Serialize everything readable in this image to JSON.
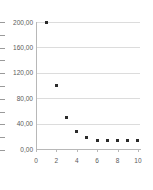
{
  "chart_data": {
    "type": "scatter",
    "title": "",
    "subtitle": "",
    "xlabel": "",
    "ylabel": ")",
    "x": [
      1,
      2,
      3,
      4,
      5,
      6,
      7,
      8,
      9,
      10
    ],
    "values": [
      200,
      100,
      50,
      28,
      18,
      14,
      13,
      13,
      13,
      13
    ],
    "series": [
      {
        "name": "",
        "x": [
          1,
          2,
          3,
          4,
          5,
          6,
          7,
          8,
          9,
          10
        ],
        "values": [
          200,
          100,
          50,
          28,
          18,
          14,
          13,
          13,
          13,
          13
        ],
        "marker_color": "#2b2b2b",
        "marker_shape": "square"
      }
    ],
    "xlim": [
      0,
      10.2
    ],
    "ylim": [
      0,
      210
    ],
    "ytick_values": [
      200,
      160,
      120,
      80,
      40,
      0
    ],
    "ytick_labels": [
      "200,00",
      "160,00",
      "120,00",
      "80,00",
      "40,00",
      "0,00"
    ],
    "xtick_values": [
      0,
      2,
      4,
      6,
      8,
      10
    ],
    "xtick_labels": [
      "0",
      "2",
      "4",
      "6",
      "8",
      "10"
    ],
    "grid": true,
    "grid_axis": "y",
    "legend": false,
    "legend_position": "none",
    "annotations": [],
    "decimal_separator": ","
  },
  "axis_colors": {
    "grid": "#dcdcdc",
    "axis": "#b8b8b8",
    "tick_text": "#5a5a5a",
    "marker": "#2b2b2b",
    "background": "#ffffff"
  },
  "clipped_axis": {
    "title_fragment": ")",
    "tick_count": 11
  }
}
